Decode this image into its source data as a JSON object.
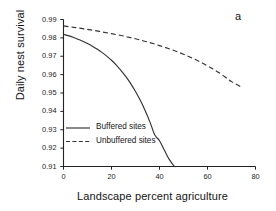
{
  "figure": {
    "panel_label": "a",
    "background_color": "#ffffff",
    "axis_color": "#222222"
  },
  "chart_data": {
    "type": "line",
    "title": "",
    "subtitle": "",
    "panel_label": "a",
    "xlabel": "Landscape percent agriculture",
    "ylabel": "Daily nest survival",
    "xlim": [
      0,
      80
    ],
    "ylim": [
      0.91,
      0.99
    ],
    "xticks": [
      0,
      20,
      40,
      60,
      80
    ],
    "xtick_labels": [
      "0",
      "20",
      "40",
      "60",
      "80"
    ],
    "yticks": [
      0.91,
      0.92,
      0.93,
      0.94,
      0.95,
      0.96,
      0.97,
      0.98,
      0.99
    ],
    "ytick_labels": [
      "0.91",
      "0.92",
      "0.93",
      "0.94",
      "0.95",
      "0.96",
      "0.97",
      "0.98",
      "0.99"
    ],
    "grid": false,
    "legend_position": "center-left-inside",
    "series": [
      {
        "name": "Buffered sites",
        "style": "solid",
        "color": "#333333",
        "x": [
          0,
          2,
          4,
          6,
          8,
          10,
          12,
          14,
          16,
          18,
          20,
          22,
          24,
          26,
          28,
          30,
          32,
          34,
          36,
          38,
          40,
          42,
          44,
          46,
          46.6
        ],
        "values": [
          0.982,
          0.9812,
          0.9803,
          0.9793,
          0.9782,
          0.9769,
          0.9755,
          0.9739,
          0.9721,
          0.9701,
          0.9678,
          0.9652,
          0.9622,
          0.9589,
          0.9551,
          0.9508,
          0.946,
          0.9405,
          0.9343,
          0.9273,
          0.924,
          0.919,
          0.914,
          0.9103,
          0.91
        ]
      },
      {
        "name": "Unbuffered sites",
        "style": "dashed",
        "color": "#333333",
        "x": [
          0,
          5,
          10,
          15,
          20,
          25,
          30,
          35,
          40,
          45,
          50,
          55,
          60,
          65,
          70,
          74.5
        ],
        "values": [
          0.9865,
          0.9856,
          0.9846,
          0.9835,
          0.9823,
          0.981,
          0.9795,
          0.9778,
          0.9758,
          0.9736,
          0.9711,
          0.9682,
          0.9648,
          0.9609,
          0.9562,
          0.953
        ]
      }
    ],
    "legend": [
      {
        "label": "Buffered sites",
        "style": "solid"
      },
      {
        "label": "Unbuffered sites",
        "style": "dashed"
      }
    ]
  }
}
